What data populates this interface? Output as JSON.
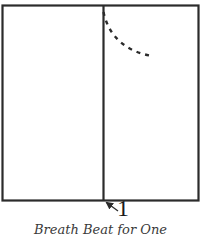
{
  "diagram": {
    "kind": "breath-pattern-diagram",
    "stroke_color": "#2b2b2b",
    "outer_box": {
      "x": 2.5,
      "y": 5.5,
      "width": 196,
      "height": 195
    },
    "divider": {
      "x": 103.5,
      "y1": 5.5,
      "y2": 200.5
    },
    "dashed_curve": {
      "start": [
        103,
        12
      ],
      "end": [
        153,
        56
      ],
      "style": "dashed"
    },
    "marker": {
      "label": "1",
      "arrow_from": [
        117,
        209
      ],
      "arrow_to": [
        105,
        201
      ]
    },
    "caption": "Breath Beat for One"
  }
}
